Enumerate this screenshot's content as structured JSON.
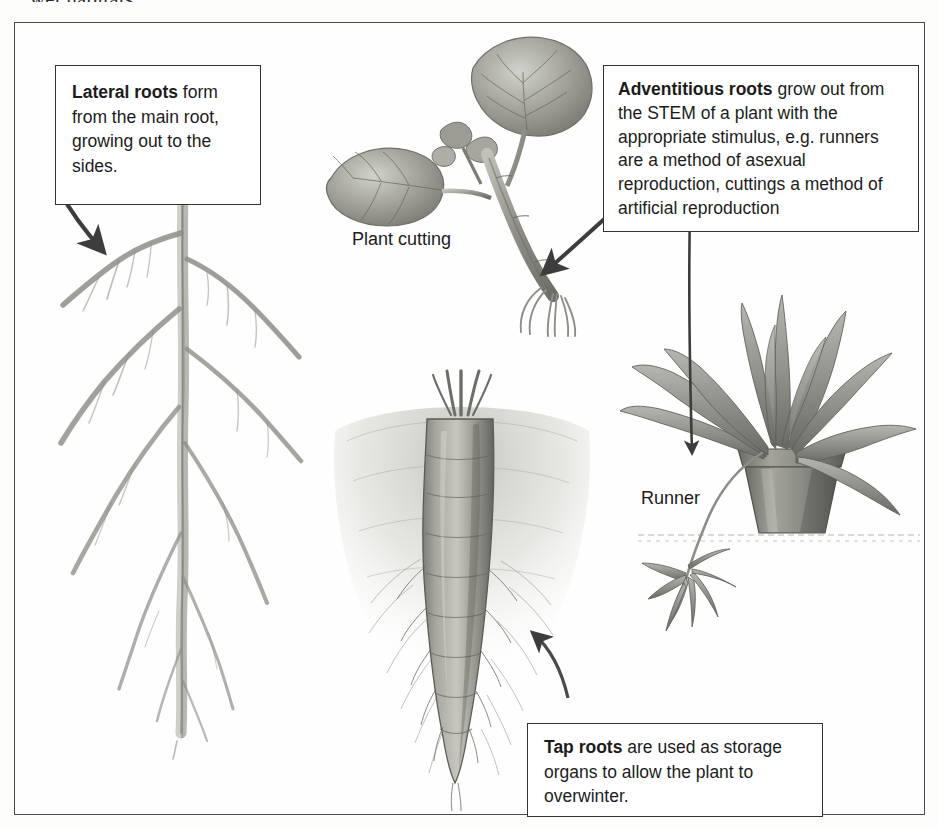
{
  "page": {
    "runover_text": "wet habitats.",
    "background": "#fdfdfc",
    "frame_border_color": "#4a4a4a"
  },
  "figure": {
    "callouts": [
      {
        "id": "lateral",
        "bold_lead": "Lateral roots",
        "body": " form from the main root, growing out to the sides.",
        "full_text": "Lateral roots form from the main root, growing out to the sides."
      },
      {
        "id": "adventitious",
        "bold_lead": "Adventitious roots",
        "body": " grow out from the STEM of a plant with the appropriate stimulus, e.g. runners are a method of asexual reproduction, cuttings a method of artificial reproduction",
        "full_text": "Adventitious roots grow out from the STEM of a plant with the appropriate stimulus, e.g. runners are a method of asexual reproduction, cuttings a method of artificial reproduction"
      },
      {
        "id": "tap",
        "bold_lead": "Tap roots",
        "body": " are used as storage organs to allow the plant to overwinter.",
        "full_text": "Tap roots are used as storage organs to allow the plant to overwinter."
      }
    ],
    "labels": {
      "plant_cutting": "Plant cutting",
      "runner": "Runner"
    },
    "illustrations": [
      {
        "id": "lateral-root",
        "name": "lateral root system drawing"
      },
      {
        "id": "plant-cutting",
        "name": "plant cutting with two leaves and adventitious roots"
      },
      {
        "id": "carrot",
        "name": "carrot tap root in soil"
      },
      {
        "id": "spider-plant",
        "name": "potted spider plant with runner and plantlet"
      }
    ],
    "arrows": [
      {
        "id": "arrow-to-lateral-root",
        "from": "lateral callout",
        "to": "lateral root"
      },
      {
        "id": "arrow-to-cutting-roots",
        "from": "adventitious callout",
        "to": "cutting roots"
      },
      {
        "id": "arrow-to-runner",
        "from": "adventitious callout",
        "to": "runner plantlet"
      },
      {
        "id": "arrow-to-carrot",
        "from": "tap callout",
        "to": "carrot root"
      }
    ],
    "colors": {
      "text": "#1c1c1c",
      "box_border": "#333333",
      "arrow": "#3d3d3d",
      "art_mid": "#9a9a96",
      "art_dark": "#5f5f5c",
      "art_light": "#cfcfca"
    }
  }
}
